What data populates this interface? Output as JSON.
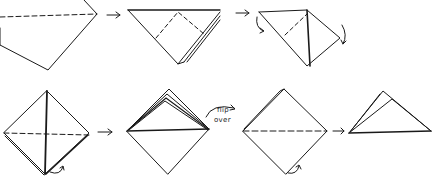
{
  "diagram": {
    "type": "origami-folding-sequence",
    "stroke_color": "#1a1a1a",
    "dash_color": "#333333",
    "background": "#ffffff",
    "rows": [
      {
        "steps": [
          {
            "id": "step-1",
            "desc": "square diamond with horizontal dashed fold line"
          },
          {
            "id": "step-2",
            "desc": "triangle with dashed diagonal folds"
          },
          {
            "id": "step-3",
            "desc": "folded flaps with curved arrows"
          }
        ]
      },
      {
        "steps": [
          {
            "id": "step-4",
            "desc": "diamond with vertical crease and dashed horizontal fold"
          },
          {
            "id": "step-5",
            "desc": "diamond with layered top flaps"
          },
          {
            "id": "step-6",
            "desc": "diamond with dashed horizontal fold and curved arrow"
          },
          {
            "id": "step-7",
            "desc": "final layered triangle"
          }
        ]
      }
    ],
    "annotations": {
      "flip_line1": "flip",
      "flip_line2": "over"
    }
  }
}
